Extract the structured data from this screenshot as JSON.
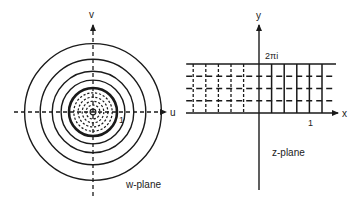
{
  "figure": {
    "ink_color": "#1a1a1a",
    "background": "#ffffff"
  },
  "w_plane": {
    "plane_label": "w-plane",
    "horizontal_axis_label": "u",
    "vertical_axis_label": "v",
    "unit_marker_label": "1",
    "solid_circles": [
      {
        "modulus": 2.85,
        "style": "solid"
      },
      {
        "modulus": 2.2,
        "style": "solid"
      },
      {
        "modulus": 1.7,
        "style": "solid"
      },
      {
        "modulus": 1.33,
        "style": "solid"
      },
      {
        "modulus": 1.0,
        "style": "solid-thick"
      }
    ],
    "dashed_circles": [
      {
        "modulus": 0.8
      },
      {
        "modulus": 0.62
      },
      {
        "modulus": 0.45
      },
      {
        "modulus": 0.29
      }
    ],
    "origin_circle": {
      "modulus": 0.12,
      "style": "solid"
    }
  },
  "z_plane": {
    "plane_label": "z-plane",
    "horizontal_axis_label": "x",
    "vertical_axis_label": "y",
    "top_boundary_label": "2πi",
    "unit_marker_label": "1",
    "strip": {
      "y_min": 0,
      "y_max": "2π"
    },
    "horizontal_dashed_lines_fraction": [
      0.25,
      0.5,
      0.75
    ],
    "vertical_dashed_lines_x": [
      -2.35,
      -1.9,
      -1.45,
      -1.0,
      -0.55
    ],
    "vertical_solid_lines_x": [
      0.45,
      0.9,
      1.35,
      1.8,
      2.25
    ],
    "left_edge_x": -2.6
  }
}
